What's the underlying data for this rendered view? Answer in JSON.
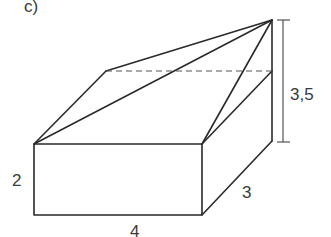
{
  "figure": {
    "part_label": "c)",
    "dimensions": {
      "height_box": "2",
      "length": "4",
      "depth": "3",
      "total_height": "3,5"
    },
    "colors": {
      "stroke": "#2a2a2a",
      "label": "#3a3a3a",
      "background": "#ffffff"
    }
  }
}
